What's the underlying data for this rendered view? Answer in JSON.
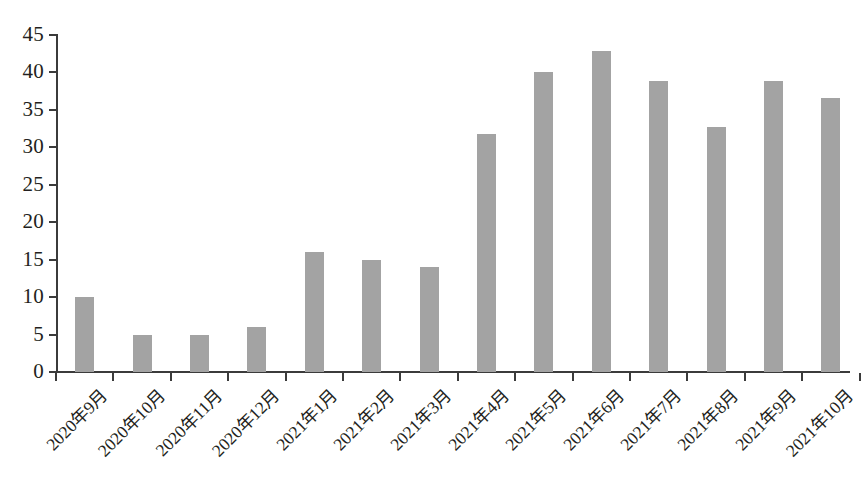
{
  "chart_data": {
    "type": "bar",
    "title": "",
    "subtitle": "",
    "xlabel": "",
    "ylabel": "",
    "ylim": [
      0,
      45
    ],
    "ytick_step": 5,
    "yticks": [
      0,
      5,
      10,
      15,
      20,
      25,
      30,
      35,
      40,
      45
    ],
    "grid": false,
    "legend": null,
    "legend_position": "none",
    "bar_color": "#a3a3a3",
    "axis_color": "#3b3b3b",
    "background_color": "#ffffff",
    "xtick_label_rotation": -45,
    "categories": [
      "2020年9月",
      "2020年10月",
      "2020年11月",
      "2020年12月",
      "2021年1月",
      "2021年2月",
      "2021年3月",
      "2021年4月",
      "2021年5月",
      "2021年6月",
      "2021年7月",
      "2021年8月",
      "2021年9月",
      "2021年10月"
    ],
    "values": [
      10,
      5,
      5,
      6,
      16,
      15,
      14,
      31.8,
      40,
      42.9,
      38.8,
      32.7,
      38.8,
      36.6
    ],
    "series": [
      {
        "name": "",
        "values": [
          10,
          5,
          5,
          6,
          16,
          15,
          14,
          31.8,
          40,
          42.9,
          38.8,
          32.7,
          38.8,
          36.6
        ]
      }
    ],
    "annotations": []
  }
}
